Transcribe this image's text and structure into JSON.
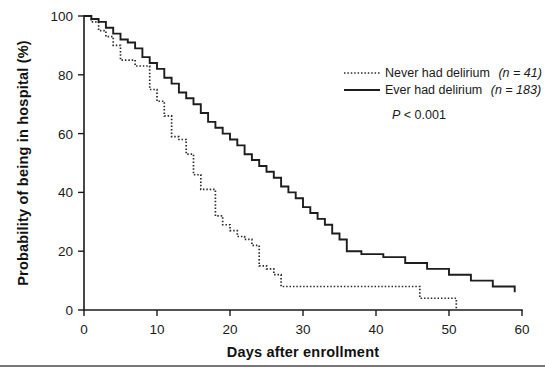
{
  "chart_data": {
    "type": "line",
    "title": "",
    "xlabel": "Days after enrollment",
    "ylabel": "Probability of being in hospital (%)",
    "xlim": [
      0,
      60
    ],
    "ylim": [
      0,
      100
    ],
    "xticks": [
      0,
      10,
      20,
      30,
      40,
      50,
      60
    ],
    "yticks": [
      0,
      20,
      40,
      60,
      80,
      100
    ],
    "grid": false,
    "legend_position": "upper-right",
    "annotations": [
      "P < 0.001"
    ],
    "series": [
      {
        "name": "Never had delirium (n = 41)",
        "label_main": "Never had delirium",
        "label_paren": "(n = 41)",
        "n": 41,
        "style": "dotted",
        "color": "#2b2b2b",
        "x": [
          0,
          1,
          2,
          3,
          4,
          5,
          6,
          7,
          8,
          9,
          10,
          11,
          12,
          13,
          14,
          15,
          16,
          17,
          18,
          19,
          20,
          21,
          22,
          23,
          24,
          25,
          26,
          27,
          35,
          46,
          51
        ],
        "y": [
          100,
          98,
          95,
          93,
          90,
          85,
          85,
          83,
          83,
          75,
          71,
          66,
          59,
          58,
          53,
          46,
          41,
          41,
          32,
          29,
          27,
          25,
          24,
          22,
          15,
          14,
          12,
          8,
          8,
          4,
          0
        ]
      },
      {
        "name": "Ever had delirium (n = 183)",
        "label_main": "Ever had delirium",
        "label_paren": "(n = 183)",
        "n": 183,
        "style": "solid",
        "color": "#1d1d1d",
        "x": [
          0,
          1,
          2,
          3,
          4,
          5,
          6,
          7,
          8,
          9,
          10,
          11,
          12,
          13,
          14,
          15,
          16,
          17,
          18,
          19,
          20,
          21,
          22,
          23,
          24,
          25,
          26,
          27,
          28,
          29,
          30,
          31,
          32,
          33,
          34,
          35,
          36,
          38,
          41,
          44,
          47,
          50,
          53,
          56,
          59
        ],
        "y": [
          100,
          99,
          98,
          96,
          94,
          92,
          91,
          89,
          86,
          84,
          82,
          79,
          77,
          74,
          72,
          70,
          67,
          64,
          62,
          60,
          58,
          56,
          53,
          51,
          49,
          47,
          45,
          42,
          40,
          38,
          35,
          33,
          31,
          29,
          26,
          24,
          20,
          19,
          18,
          16,
          14,
          12,
          10,
          8,
          6
        ]
      }
    ]
  },
  "axes": {
    "y_axis_title": "Probability of being in hospital (%)",
    "x_axis_title": "Days after enrollment",
    "y_tick_labels": [
      "0",
      "20",
      "40",
      "60",
      "80",
      "100"
    ],
    "x_tick_labels": [
      "0",
      "10",
      "20",
      "30",
      "40",
      "50",
      "60"
    ]
  },
  "legend": {
    "items": [
      {
        "label": "Never had delirium",
        "paren": "(n = 41)",
        "marker": "dotted-line-swatch"
      },
      {
        "label": "Ever had delirium",
        "paren": "(n = 183)",
        "marker": "solid-line-swatch"
      }
    ],
    "pvalue": "P < 0.001",
    "pvalue_italic_prefix": "P",
    "pvalue_rest": " < 0.001"
  }
}
